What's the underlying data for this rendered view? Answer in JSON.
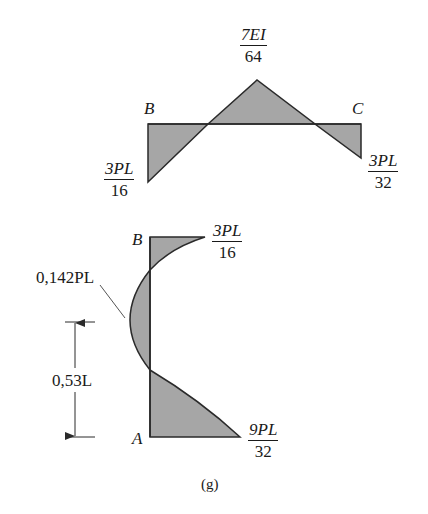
{
  "figure": {
    "caption": "(g)",
    "colors": {
      "fill": "#a6a6a6",
      "stroke": "#2a2a2a",
      "background": "#ffffff"
    }
  },
  "top_diagram": {
    "member": "BC",
    "labels": {
      "left_node": "B",
      "right_node": "C",
      "peak": {
        "num": "7EI",
        "den": "64"
      },
      "left_end": {
        "num": "3PL",
        "den": "16"
      },
      "right_end": {
        "num": "3PL",
        "den": "32"
      }
    }
  },
  "bottom_diagram": {
    "member": "AB",
    "labels": {
      "top_node": "B",
      "bottom_node": "A",
      "top_end": {
        "num": "3PL",
        "den": "16"
      },
      "bottom_end": {
        "num": "9PL",
        "den": "32"
      },
      "max_moment": "0,142PL",
      "dimension": "0,53L"
    }
  }
}
